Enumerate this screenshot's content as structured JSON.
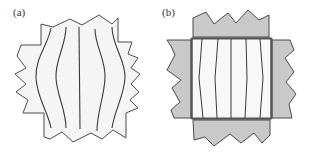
{
  "figure": {
    "panels": [
      {
        "id": "a",
        "label": "(a)",
        "description": "Specimen without clamps: outline jagged, internal lines bulging outward at center"
      },
      {
        "id": "b",
        "label": "(b)",
        "description": "Specimen with four gripping clamps on each side: internal lines nearly straight, slight inward bow"
      }
    ]
  },
  "colors": {
    "outline": "#4a4a4a",
    "specimen_fill": "#f5f5f5",
    "clamp_fill": "#c9c9c9",
    "line": "#3a3a3a",
    "background": "#ffffff"
  }
}
